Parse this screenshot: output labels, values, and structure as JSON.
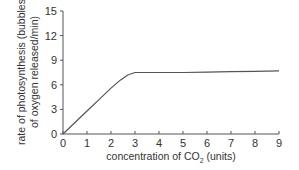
{
  "chart_data": {
    "type": "line",
    "title": "",
    "xlabel": "concentration of CO2 (units)",
    "xlabel_main": "concentration of CO",
    "xlabel_sub": "2",
    "xlabel_tail": " (units)",
    "ylabel_line1": "rate of photosynthesis (bubbles",
    "ylabel_line2": "of oxygen released/min)",
    "ylabel": "rate of photosynthesis (bubbles of oxygen released/min)",
    "xlim": [
      0,
      9
    ],
    "ylim": [
      0,
      15
    ],
    "x_ticks": [
      0,
      1,
      2,
      3,
      4,
      5,
      6,
      7,
      8,
      9
    ],
    "y_ticks": [
      0,
      3,
      6,
      9,
      12,
      15
    ],
    "grid": false,
    "legend": null,
    "series": [
      {
        "name": "rate of photosynthesis",
        "color": "#555555",
        "x": [
          0,
          0.5,
          1,
          1.5,
          2,
          2.4,
          2.7,
          3,
          4,
          5,
          6,
          7,
          8,
          9
        ],
        "y": [
          0,
          1.4,
          2.8,
          4.2,
          5.6,
          6.6,
          7.2,
          7.5,
          7.5,
          7.5,
          7.55,
          7.6,
          7.65,
          7.7
        ]
      }
    ]
  }
}
